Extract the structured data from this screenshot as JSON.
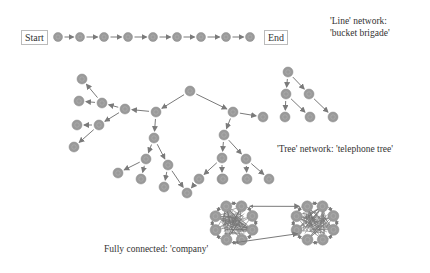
{
  "line_network": {
    "start_label": "Start",
    "end_label": "End",
    "caption_line1": "'Line' network:",
    "caption_line2": "'bucket brigade'",
    "nodes": [
      [
        58,
        37
      ],
      [
        80,
        37
      ],
      [
        104,
        37
      ],
      [
        128,
        37
      ],
      [
        153,
        37
      ],
      [
        177,
        37
      ],
      [
        201,
        37
      ],
      [
        226,
        37
      ],
      [
        250,
        37
      ]
    ]
  },
  "tree_network": {
    "caption": "'Tree' network: 'telephone tree'",
    "nodes": [
      [
        190,
        91
      ],
      [
        156,
        112
      ],
      [
        125,
        109
      ],
      [
        102,
        103
      ],
      [
        82,
        79
      ],
      [
        79,
        101
      ],
      [
        99,
        125
      ],
      [
        77,
        125
      ],
      [
        74,
        147
      ],
      [
        154,
        138
      ],
      [
        146,
        159
      ],
      [
        168,
        165
      ],
      [
        118,
        173
      ],
      [
        141,
        179
      ],
      [
        164,
        187
      ],
      [
        187,
        193
      ],
      [
        233,
        112
      ],
      [
        224,
        135
      ],
      [
        222,
        158
      ],
      [
        199,
        179
      ],
      [
        222,
        179
      ],
      [
        246,
        159
      ],
      [
        223,
        179
      ],
      [
        247,
        179
      ],
      [
        269,
        179
      ],
      [
        263,
        117
      ],
      [
        288,
        72
      ],
      [
        286,
        94
      ],
      [
        309,
        94
      ],
      [
        285,
        117
      ],
      [
        310,
        117
      ],
      [
        333,
        117
      ]
    ],
    "edges": [
      [
        0,
        1
      ],
      [
        0,
        16
      ],
      [
        1,
        2
      ],
      [
        2,
        3
      ],
      [
        3,
        4
      ],
      [
        3,
        5
      ],
      [
        2,
        6
      ],
      [
        6,
        7
      ],
      [
        6,
        8
      ],
      [
        1,
        9
      ],
      [
        9,
        10
      ],
      [
        9,
        11
      ],
      [
        10,
        12
      ],
      [
        10,
        13
      ],
      [
        11,
        14
      ],
      [
        11,
        15
      ],
      [
        16,
        17
      ],
      [
        16,
        25
      ],
      [
        17,
        18
      ],
      [
        18,
        19
      ],
      [
        18,
        20
      ],
      [
        19,
        15
      ],
      [
        17,
        21
      ],
      [
        21,
        23
      ],
      [
        21,
        24
      ],
      [
        26,
        27
      ],
      [
        26,
        28
      ],
      [
        27,
        29
      ],
      [
        27,
        30
      ],
      [
        28,
        31
      ]
    ]
  },
  "fully_connected": {
    "caption": "Fully connected: 'company'",
    "clusters": [
      {
        "cx": 234,
        "cy": 223,
        "r": 19
      },
      {
        "cx": 315,
        "cy": 223,
        "r": 19
      }
    ]
  },
  "colors": {
    "node_fill": "#9a9a9a",
    "node_stroke": "#8a8a8a",
    "edge": "#7a7a7a",
    "text": "#333333"
  }
}
